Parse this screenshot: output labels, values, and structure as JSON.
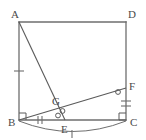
{
  "figure": {
    "type": "geometry-diagram",
    "canvas": {
      "width": 146,
      "height": 140
    },
    "stroke_color": "#555555",
    "label_color": "#4a4a4a",
    "background": "#ffffff",
    "points": [
      {
        "id": "A",
        "label": "A",
        "x": 19,
        "y": 22,
        "label_x": 11,
        "label_y": 18
      },
      {
        "id": "D",
        "label": "D",
        "x": 126,
        "y": 22,
        "label_x": 128,
        "label_y": 18
      },
      {
        "id": "B",
        "label": "B",
        "x": 19,
        "y": 120,
        "label_x": 10,
        "label_y": 126
      },
      {
        "id": "C",
        "label": "C",
        "x": 126,
        "y": 120,
        "label_x": 129,
        "label_y": 126
      },
      {
        "id": "E",
        "label": "E",
        "x": 65,
        "y": 120,
        "label_x": 62,
        "label_y": 133
      },
      {
        "id": "F",
        "label": "F",
        "x": 126,
        "y": 88,
        "label_x": 129,
        "label_y": 86
      },
      {
        "id": "G",
        "label": "G",
        "x": 59,
        "y": 107,
        "label_x": 53,
        "label_y": 104
      }
    ],
    "segments": [
      {
        "name": "side-AD",
        "from": "A",
        "to": "D"
      },
      {
        "name": "side-AB",
        "from": "A",
        "to": "B"
      },
      {
        "name": "side-BC",
        "from": "B",
        "to": "C"
      },
      {
        "name": "side-DC",
        "from": "D",
        "to": "C"
      },
      {
        "name": "cevian-AE",
        "from": "A",
        "to": "E"
      },
      {
        "name": "cevian-BF",
        "from": "B",
        "to": "F"
      }
    ],
    "arc": {
      "name": "arc-B-to-C",
      "from": "B",
      "to": "C",
      "sag": 14,
      "tick_count": 1
    },
    "right_angles": [
      {
        "name": "right-angle-at-B",
        "vertex": "B",
        "size": 7
      },
      {
        "name": "right-angle-at-C",
        "vertex": "C",
        "size": 7
      }
    ],
    "angle_marks": [
      {
        "name": "angle-mark-at-E",
        "glyph": "o",
        "x": 58,
        "y": 116
      },
      {
        "name": "angle-mark-at-G",
        "glyph": "o",
        "x": 62,
        "y": 111
      },
      {
        "name": "angle-mark-at-F",
        "glyph": "o",
        "x": 118,
        "y": 92
      }
    ],
    "tick_marks": [
      {
        "name": "tick-on-AB",
        "x": 19,
        "y": 71,
        "orientation": "horizontal",
        "count": 1
      },
      {
        "name": "tick-on-BE",
        "x": 40,
        "y": 120,
        "orientation": "vertical",
        "count": 2
      },
      {
        "name": "tick-on-FC",
        "x": 126,
        "y": 104,
        "orientation": "horizontal",
        "count": 2
      },
      {
        "name": "tick-on-arc",
        "x": 72,
        "y": 133,
        "orientation": "vertical",
        "count": 1
      }
    ]
  }
}
